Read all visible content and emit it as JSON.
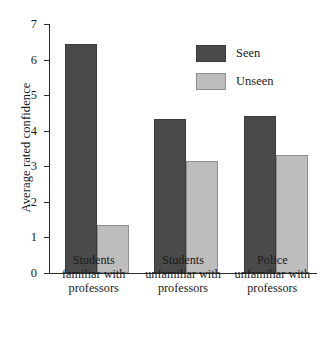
{
  "chart_data": {
    "type": "bar",
    "title": "",
    "xlabel": "",
    "ylabel": "Average rated confidence",
    "ylim": [
      0,
      7
    ],
    "yticks": [
      0,
      1,
      2,
      3,
      4,
      5,
      6,
      7
    ],
    "grid": false,
    "legend_position": "top-right",
    "categories": [
      "Students\nfamiliar with\nprofessors",
      "Students\nunfamiliar with\nprofessors",
      "Police\nunfamiliar with\nprofessors"
    ],
    "category_lines": [
      [
        "Students",
        "familiar with",
        "professors"
      ],
      [
        "Students",
        "unfamiliar with",
        "professors"
      ],
      [
        "Police",
        "unfamiliar with",
        "professors"
      ]
    ],
    "series": [
      {
        "name": "Seen",
        "color": "#4a4a4a",
        "values": [
          6.43,
          4.33,
          4.41
        ]
      },
      {
        "name": "Unseen",
        "color": "#bdbdbd",
        "values": [
          1.35,
          3.15,
          3.31
        ]
      }
    ]
  },
  "legend": {
    "items": [
      {
        "label": "Seen"
      },
      {
        "label": "Unseen"
      }
    ]
  },
  "axis": {
    "y_title": "Average rated confidence"
  }
}
